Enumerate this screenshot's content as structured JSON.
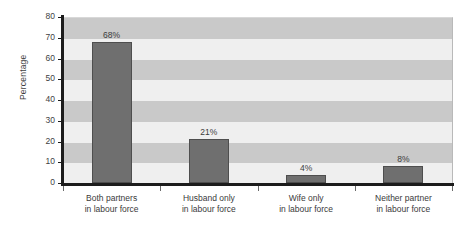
{
  "chart_data": {
    "type": "bar",
    "title": "",
    "xlabel": "",
    "ylabel": "Percentage",
    "ylim": [
      0,
      80
    ],
    "yticks": [
      0,
      10,
      20,
      30,
      40,
      50,
      60,
      70,
      80
    ],
    "ytick_labels": [
      "0",
      "10",
      "20",
      "30",
      "40",
      "50",
      "60",
      "70",
      "80"
    ],
    "grid": false,
    "banded_background": true,
    "legend": null,
    "categories": [
      "Both partners\nin labour force",
      "Husband only\nin labour force",
      "Wife only\nin labour force",
      "Neither partner\nin labour force"
    ],
    "category_lines": [
      [
        "Both partners",
        "in labour force"
      ],
      [
        "Husband only",
        "in labour force"
      ],
      [
        "Wife only",
        "in labour force"
      ],
      [
        "Neither partner",
        "in labour force"
      ]
    ],
    "values": [
      68,
      21,
      4,
      8
    ],
    "data_labels": [
      "68%",
      "21%",
      "4%",
      "8%"
    ],
    "colors": {
      "bar_fill": "#6f6f6f",
      "bar_edge": "#4e4e4e",
      "band_light": "#efefef",
      "band_dark": "#c9c9c9",
      "axis": "#1c1c1c",
      "text": "#3a3a3a"
    }
  }
}
